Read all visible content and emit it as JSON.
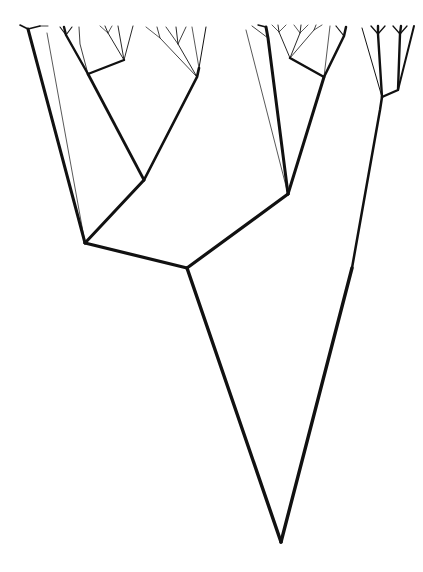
{
  "figure": {
    "type": "dendrogram",
    "width": 423,
    "height": 572,
    "background_color": "#ffffff",
    "stroke_color": "#111111"
  },
  "chart_data": {
    "type": "tree",
    "xlabel": "",
    "ylabel": "",
    "grid": false,
    "legend": "none",
    "xlim": [
      0,
      423
    ],
    "ylim": [
      0,
      572
    ],
    "stroke_widths": {
      "root": 3.4,
      "backbone": 3.2,
      "major": 2.9,
      "medium": 2.2,
      "minor": 1.3,
      "twig": 0.7
    },
    "nodes": {
      "root_tip": [
        281,
        542
      ],
      "root_junction": [
        187,
        268
      ],
      "left_node": [
        85,
        243
      ],
      "right_node": [
        288,
        194
      ],
      "left_inner_node": [
        144,
        180
      ],
      "left_upper_node": [
        88,
        73
      ],
      "right_upper_node": [
        324,
        76
      ],
      "far_right_node": [
        382,
        97
      ],
      "far_right_fork": [
        386,
        87
      ]
    },
    "edges": [
      {
        "name": "root-stem-left",
        "from": [
          187,
          268
        ],
        "to": [
          281,
          542
        ],
        "width": 3.4
      },
      {
        "name": "root-stem-right",
        "from": [
          281,
          542
        ],
        "to": [
          352,
          268
        ],
        "width": 3.4
      },
      {
        "name": "root-to-far-right",
        "from": [
          352,
          268
        ],
        "to": [
          382,
          97
        ],
        "width": 2.6
      },
      {
        "name": "root-to-left-node",
        "from": [
          187,
          268
        ],
        "to": [
          85,
          243
        ],
        "width": 3.2
      },
      {
        "name": "root-to-right-node",
        "from": [
          187,
          268
        ],
        "to": [
          288,
          194
        ],
        "width": 3.2
      },
      {
        "name": "left-node-to-leftmost-leaf",
        "from": [
          85,
          243
        ],
        "to": [
          28,
          28
        ],
        "width": 3.0
      },
      {
        "name": "left-node-to-inner",
        "from": [
          85,
          243
        ],
        "to": [
          144,
          180
        ],
        "width": 3.0
      },
      {
        "name": "inner-to-left-upper",
        "from": [
          144,
          180
        ],
        "to": [
          88,
          73
        ],
        "width": 2.6
      },
      {
        "name": "inner-to-mid-leaf",
        "from": [
          144,
          180
        ],
        "to": [
          197,
          76
        ],
        "width": 2.6
      },
      {
        "name": "right-node-to-vertical-leaf",
        "from": [
          288,
          194
        ],
        "to": [
          266,
          27
        ],
        "width": 3.0
      },
      {
        "name": "right-node-to-right-upper",
        "from": [
          288,
          194
        ],
        "to": [
          324,
          76
        ],
        "width": 3.0
      }
    ],
    "leaf_tip_x_positions": [
      24,
      33,
      46,
      58,
      68,
      79,
      95,
      105,
      118,
      133,
      145,
      157,
      166,
      178,
      190,
      199,
      210,
      222,
      234,
      246,
      258,
      266,
      279,
      290,
      301,
      312,
      322,
      333,
      344,
      356,
      366,
      378,
      389,
      400,
      412
    ],
    "leaf_tip_y": 26,
    "leaf_count": 35
  }
}
